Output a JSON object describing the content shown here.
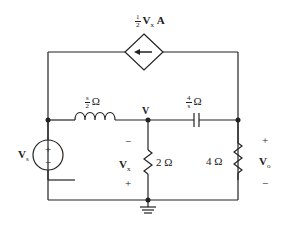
{
  "diagram": {
    "type": "circuit",
    "dependent_source": {
      "coef_num": "1",
      "coef_den": "2",
      "var": "V",
      "sub": "x",
      "unit": "A",
      "direction": "left"
    },
    "inductor": {
      "num": "s",
      "den": "2",
      "unit": "Ω"
    },
    "capacitor": {
      "num": "4",
      "den": "s",
      "unit": "Ω"
    },
    "node_label": "V",
    "source": {
      "var": "V",
      "sub": "s",
      "plus": "+",
      "minus": "−"
    },
    "resistor_2": {
      "label": "2 Ω"
    },
    "resistor_4": {
      "label": "4 Ω"
    },
    "vx": {
      "var": "V",
      "sub": "x",
      "top_sign": "−",
      "bottom_sign": "+"
    },
    "vo": {
      "var": "V",
      "sub": "o",
      "top_sign": "+",
      "bottom_sign": "−"
    },
    "colors": {
      "line": "#222222",
      "background": "#ffffff"
    }
  }
}
